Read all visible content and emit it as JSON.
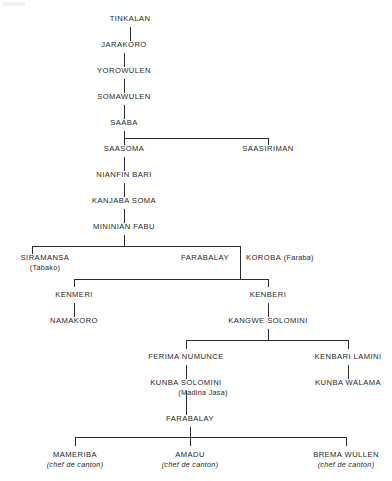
{
  "diagram": {
    "type": "genealogy-tree",
    "title": "",
    "orientation": "top-down",
    "line_color": "#2b2b2b",
    "background_color": "#ffffff",
    "text_color": "#1f1f1f",
    "nodes": [
      {
        "id": "tinkalan",
        "name": "TINKALAN",
        "note": "",
        "note_style": "none",
        "x": 130,
        "y": 18,
        "align": "center"
      },
      {
        "id": "jarakoro",
        "name": "JARAKORO",
        "note": "",
        "note_style": "none",
        "x": 124,
        "y": 44,
        "align": "center"
      },
      {
        "id": "yorowulen",
        "name": "YOROWULEN",
        "note": "",
        "note_style": "none",
        "x": 124,
        "y": 70,
        "align": "center"
      },
      {
        "id": "somawulen",
        "name": "SOMAWULEN",
        "note": "",
        "note_style": "none",
        "x": 124,
        "y": 96,
        "align": "center"
      },
      {
        "id": "saaba",
        "name": "SAABA",
        "note": "",
        "note_style": "none",
        "x": 124,
        "y": 122,
        "align": "center"
      },
      {
        "id": "saasoma",
        "name": "SAASOMA",
        "note": "",
        "note_style": "none",
        "x": 124,
        "y": 148,
        "align": "center"
      },
      {
        "id": "saasiriman",
        "name": "SAASIRIMAN",
        "note": "",
        "note_style": "none",
        "x": 268,
        "y": 148,
        "align": "center"
      },
      {
        "id": "nianfin-bari",
        "name": "NIANFIN BARI",
        "note": "",
        "note_style": "none",
        "x": 124,
        "y": 174,
        "align": "center"
      },
      {
        "id": "kanjaba-soma",
        "name": "KANJABA SOMA",
        "note": "",
        "note_style": "none",
        "x": 124,
        "y": 200,
        "align": "center"
      },
      {
        "id": "mininian-fabu",
        "name": "MININIAN FABU",
        "note": "",
        "note_style": "none",
        "x": 124,
        "y": 226,
        "align": "center"
      },
      {
        "id": "siramansa",
        "name": "SIRAMANSA",
        "note": "(Tabako)",
        "note_style": "below",
        "x": 45,
        "y": 257,
        "align": "center"
      },
      {
        "id": "farabalay-1",
        "name": "FARABALAY",
        "note": "",
        "note_style": "none",
        "x": 205,
        "y": 257,
        "align": "center"
      },
      {
        "id": "koroba",
        "name": "KOROBA",
        "note": "(Faraba)",
        "note_style": "inline",
        "x": 246,
        "y": 257,
        "align": "left"
      },
      {
        "id": "kenmeri",
        "name": "KENMERI",
        "note": "",
        "note_style": "none",
        "x": 74,
        "y": 294,
        "align": "center"
      },
      {
        "id": "kenberi",
        "name": "KENBERI",
        "note": "",
        "note_style": "none",
        "x": 268,
        "y": 294,
        "align": "center"
      },
      {
        "id": "namakoro",
        "name": "NAMAKORO",
        "note": "",
        "note_style": "none",
        "x": 74,
        "y": 320,
        "align": "center"
      },
      {
        "id": "kangwe-solomini",
        "name": "KANGWE SOLOMINI",
        "note": "",
        "note_style": "none",
        "x": 268,
        "y": 320,
        "align": "center"
      },
      {
        "id": "ferima-numunce",
        "name": "FERIMA NUMUNCE",
        "note": "",
        "note_style": "none",
        "x": 186,
        "y": 356,
        "align": "center"
      },
      {
        "id": "kenbari-lamini",
        "name": "KENBARI LAMINI",
        "note": "",
        "note_style": "none",
        "x": 348,
        "y": 356,
        "align": "center"
      },
      {
        "id": "kunba-solomini",
        "name": "KUNBA SOLOMINI",
        "note": "(Madina Jasa)",
        "note_style": "below-shift",
        "x": 186,
        "y": 382,
        "align": "center"
      },
      {
        "id": "kunba-walama",
        "name": "KUNBA WALAMA",
        "note": "",
        "note_style": "none",
        "x": 348,
        "y": 382,
        "align": "center"
      },
      {
        "id": "farabalay-2",
        "name": "FARABALAY",
        "note": "",
        "note_style": "none",
        "x": 190,
        "y": 418,
        "align": "center"
      },
      {
        "id": "mameriba",
        "name": "MAMERIBA",
        "note": "(chef de canton)",
        "note_style": "below-italic",
        "x": 75,
        "y": 454,
        "align": "center"
      },
      {
        "id": "amadu",
        "name": "AMADU",
        "note": "(chef de canton)",
        "note_style": "below-italic",
        "x": 190,
        "y": 454,
        "align": "center"
      },
      {
        "id": "brema-wullen",
        "name": "BREMA WULLEN",
        "note": "(chef de canton)",
        "note_style": "below-italic",
        "x": 346,
        "y": 454,
        "align": "center"
      }
    ],
    "edges": [
      {
        "from": "tinkalan",
        "to": [
          "jarakoro"
        ]
      },
      {
        "from": "jarakoro",
        "to": [
          "yorowulen"
        ]
      },
      {
        "from": "yorowulen",
        "to": [
          "somawulen"
        ]
      },
      {
        "from": "somawulen",
        "to": [
          "saaba"
        ]
      },
      {
        "from": "saaba",
        "to": [
          "saasoma",
          "saasiriman"
        ]
      },
      {
        "from": "saasoma",
        "to": [
          "nianfin-bari"
        ]
      },
      {
        "from": "nianfin-bari",
        "to": [
          "kanjaba-soma"
        ]
      },
      {
        "from": "kanjaba-soma",
        "to": [
          "mininian-fabu"
        ]
      },
      {
        "from": "mininian-fabu",
        "to": [
          "siramansa",
          "farabalay-1-koroba"
        ]
      },
      {
        "from": "farabalay-1-koroba",
        "to": [
          "kenmeri",
          "kenberi"
        ]
      },
      {
        "from": "kenmeri",
        "to": [
          "namakoro"
        ]
      },
      {
        "from": "kenberi",
        "to": [
          "kangwe-solomini"
        ]
      },
      {
        "from": "kangwe-solomini",
        "to": [
          "ferima-numunce",
          "kenbari-lamini"
        ]
      },
      {
        "from": "ferima-numunce",
        "to": [
          "kunba-solomini"
        ]
      },
      {
        "from": "kenbari-lamini",
        "to": [
          "kunba-walama"
        ]
      },
      {
        "from": "kunba-solomini",
        "to": [
          "farabalay-2"
        ]
      },
      {
        "from": "farabalay-2",
        "to": [
          "mameriba",
          "amadu",
          "brema-wullen"
        ]
      }
    ]
  }
}
